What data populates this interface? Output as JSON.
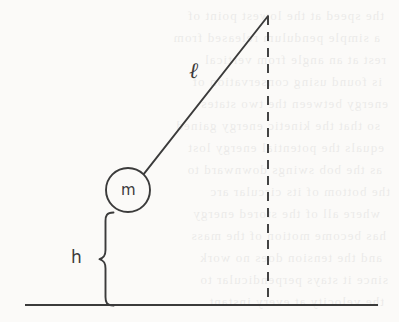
{
  "figure": {
    "kind": "pendulum-diagram",
    "background_color": "#fbfaf8",
    "ink_color": "#3b3b3b"
  },
  "labels": {
    "mass": "m",
    "height": "h",
    "length": "ℓ"
  },
  "geometry": {
    "pivot": {
      "x": 268,
      "y": 16
    },
    "bob": {
      "cx": 128,
      "cy": 190,
      "r": 22
    },
    "string": {
      "x1": 268,
      "y1": 16,
      "x2": 143.9,
      "y2": 173.8
    },
    "vertical_dashed_line": {
      "x": 268,
      "y_top": 16,
      "y_bottom": 305
    },
    "ground_line": {
      "x1": 25,
      "x2": 378,
      "y": 305
    },
    "height_brace": {
      "x_stem": 112,
      "x_tip": 100,
      "y_top": 213,
      "y_bottom": 306
    },
    "label_positions": {
      "mass": {
        "x": 128,
        "y": 191
      },
      "height": {
        "x": 78,
        "y": 258
      },
      "length": {
        "x": 196,
        "y": 72
      }
    }
  },
  "bleed_through_text": {
    "note": "faint mirrored show-through of printed text from the reverse page; illegible in the scan",
    "lines": [
      {
        "text": "the speed at the lowest point of",
        "x": 14,
        "y": 8
      },
      {
        "text": "a simple pendulum released from",
        "x": 10,
        "y": 30
      },
      {
        "text": "rest at an angle from vertical",
        "x": 16,
        "y": 52
      },
      {
        "text": "is found using conservation of",
        "x": 12,
        "y": 74
      },
      {
        "text": "energy between the two states",
        "x": 18,
        "y": 96
      },
      {
        "text": "so that the kinetic energy gained",
        "x": 10,
        "y": 118
      },
      {
        "text": "equals the potential energy lost",
        "x": 14,
        "y": 140
      },
      {
        "text": "as the bob swings downward to",
        "x": 12,
        "y": 162
      },
      {
        "text": "the bottom of its circular arc",
        "x": 20,
        "y": 184
      },
      {
        "text": "where all of the stored energy",
        "x": 10,
        "y": 206
      },
      {
        "text": "has become motion of the mass",
        "x": 16,
        "y": 228
      },
      {
        "text": "and the tension does no work",
        "x": 12,
        "y": 250
      },
      {
        "text": "since it stays perpendicular to",
        "x": 18,
        "y": 272
      },
      {
        "text": "the velocity at every instant",
        "x": 14,
        "y": 294
      }
    ]
  }
}
